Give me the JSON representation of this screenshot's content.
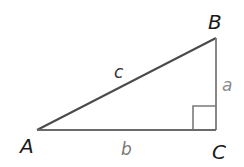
{
  "diagram": {
    "type": "right-triangle",
    "vertices": {
      "A": {
        "label": "A",
        "x": 37,
        "y": 130
      },
      "B": {
        "label": "B",
        "x": 216,
        "y": 38
      },
      "C": {
        "label": "C",
        "x": 216,
        "y": 130
      }
    },
    "sides": {
      "c": {
        "label": "c",
        "from": "A",
        "to": "B",
        "color": "#333333"
      },
      "a": {
        "label": "a",
        "from": "B",
        "to": "C",
        "color": "#888888"
      },
      "b": {
        "label": "b",
        "from": "A",
        "to": "C",
        "color": "#888888"
      }
    },
    "right_angle_at": "C",
    "line_color": "#555555",
    "right_angle_marker_color": "#777777"
  }
}
